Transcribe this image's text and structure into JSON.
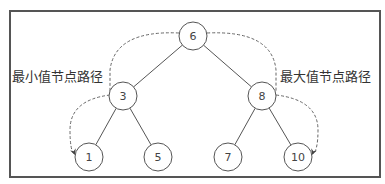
{
  "diagram": {
    "type": "binary-search-tree",
    "nodes": [
      {
        "id": "n6",
        "label": "6"
      },
      {
        "id": "n3",
        "label": "3"
      },
      {
        "id": "n8",
        "label": "8"
      },
      {
        "id": "n1",
        "label": "1"
      },
      {
        "id": "n5",
        "label": "5"
      },
      {
        "id": "n7",
        "label": "7"
      },
      {
        "id": "n10",
        "label": "10"
      }
    ],
    "edges": [
      {
        "from": "n6",
        "to": "n3"
      },
      {
        "from": "n6",
        "to": "n8"
      },
      {
        "from": "n3",
        "to": "n1"
      },
      {
        "from": "n3",
        "to": "n5"
      },
      {
        "from": "n8",
        "to": "n7"
      },
      {
        "from": "n8",
        "to": "n10"
      }
    ],
    "paths": [
      {
        "name": "min-path",
        "label": "最小值节点路径",
        "nodes": [
          "n6",
          "n3",
          "n1"
        ]
      },
      {
        "name": "max-path",
        "label": "最大值节点路径",
        "nodes": [
          "n6",
          "n8",
          "n10"
        ]
      }
    ]
  }
}
